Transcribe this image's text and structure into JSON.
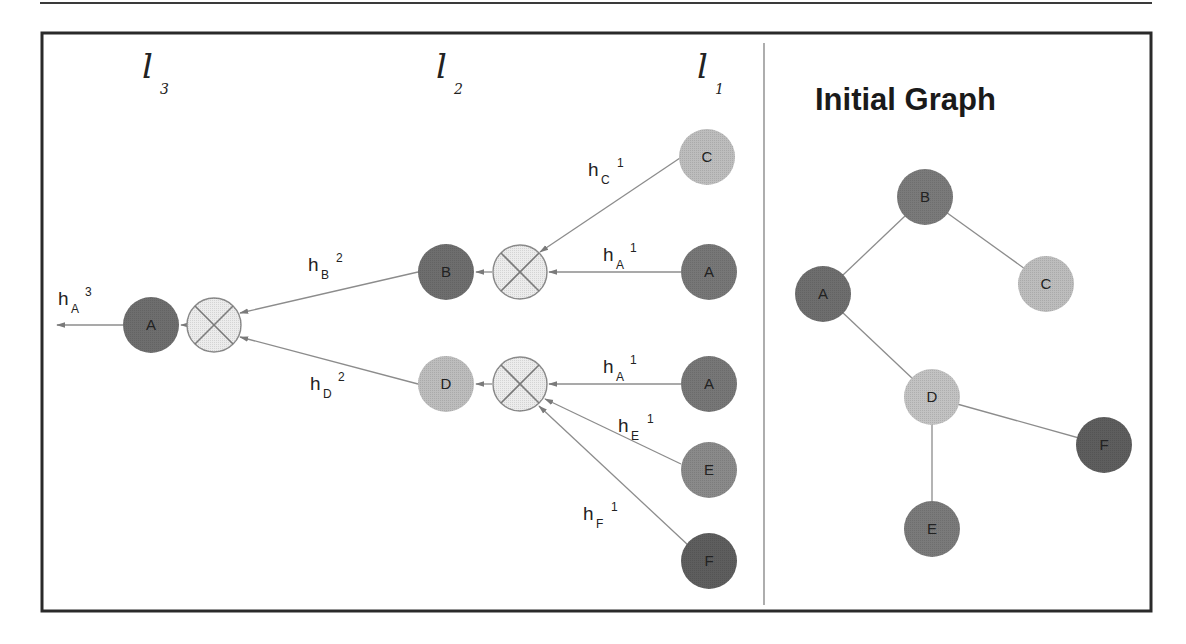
{
  "title": "Initial Graph",
  "colors": {
    "dark_node": "#6e6e6e",
    "medium_node": "#8a8a8a",
    "light_node": "#bdbdbd",
    "aggregator_fill": "#ececec",
    "edge": "#8c8c8c",
    "frame": "#2a2a2a"
  },
  "layers": [
    {
      "letter": "l",
      "sub": "3"
    },
    {
      "letter": "l",
      "sub": "2"
    },
    {
      "letter": "l",
      "sub": "1"
    }
  ],
  "computation_tree": {
    "output_label": {
      "h": "h",
      "sub": "A",
      "sup": "3"
    },
    "layer3": {
      "node": "A"
    },
    "layer2": [
      {
        "node": "B",
        "edge_label": {
          "h": "h",
          "sub": "B",
          "sup": "2"
        }
      },
      {
        "node": "D",
        "edge_label": {
          "h": "h",
          "sub": "D",
          "sup": "2"
        }
      }
    ],
    "layer1": [
      {
        "node": "C",
        "edge_label": {
          "h": "h",
          "sub": "C",
          "sup": "1"
        }
      },
      {
        "node": "A",
        "edge_label": {
          "h": "h",
          "sub": "A",
          "sup": "1"
        }
      },
      {
        "node": "A",
        "edge_label": {
          "h": "h",
          "sub": "A",
          "sup": "1"
        }
      },
      {
        "node": "E",
        "edge_label": {
          "h": "h",
          "sub": "E",
          "sup": "1"
        }
      },
      {
        "node": "F",
        "edge_label": {
          "h": "h",
          "sub": "F",
          "sup": "1"
        }
      }
    ]
  },
  "initial_graph": {
    "nodes": [
      "B",
      "A",
      "C",
      "D",
      "F",
      "E"
    ],
    "edges": [
      [
        "B",
        "A"
      ],
      [
        "B",
        "C"
      ],
      [
        "A",
        "D"
      ],
      [
        "D",
        "F"
      ],
      [
        "D",
        "E"
      ]
    ]
  }
}
